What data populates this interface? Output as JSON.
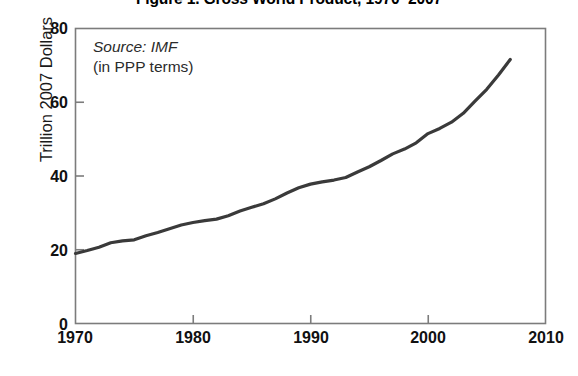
{
  "chart_data": {
    "type": "line",
    "title": "Figure 1. Gross World Product, 1970–2007",
    "xlabel": "",
    "ylabel": "Trillion 2007 Dollars",
    "xlim": [
      1970,
      2010
    ],
    "ylim": [
      0,
      80
    ],
    "grid": false,
    "legend": null,
    "annotations": {
      "source": "Source: IMF",
      "units": "(in PPP terms)"
    },
    "y_ticks": [
      "0",
      "20",
      "40",
      "60",
      "80"
    ],
    "y_tick_values": [
      0,
      20,
      40,
      60,
      80
    ],
    "x_ticks": [
      "1970",
      "1980",
      "1990",
      "2000",
      "2010"
    ],
    "x_tick_values": [
      1970,
      1980,
      1990,
      2000,
      2010
    ],
    "series": [
      {
        "name": "Gross World Product",
        "color": "#3a3a3a",
        "x": [
          1970,
          1971,
          1972,
          1973,
          1974,
          1975,
          1976,
          1977,
          1978,
          1979,
          1980,
          1981,
          1982,
          1983,
          1984,
          1985,
          1986,
          1987,
          1988,
          1989,
          1990,
          1991,
          1992,
          1993,
          1994,
          1995,
          1996,
          1997,
          1998,
          1999,
          2000,
          2001,
          2002,
          2003,
          2004,
          2005,
          2006,
          2007
        ],
        "values": [
          19.0,
          19.8,
          20.7,
          21.9,
          22.4,
          22.7,
          23.8,
          24.7,
          25.7,
          26.7,
          27.4,
          27.9,
          28.3,
          29.2,
          30.5,
          31.5,
          32.5,
          33.8,
          35.4,
          36.8,
          37.8,
          38.4,
          38.9,
          39.6,
          41.1,
          42.5,
          44.2,
          46.0,
          47.3,
          49.0,
          51.5,
          52.9,
          54.6,
          57.0,
          60.3,
          63.5,
          67.4,
          71.6
        ]
      }
    ]
  },
  "figure": {
    "source_note": "Source: IMF",
    "units_note": "(in PPP terms)"
  }
}
